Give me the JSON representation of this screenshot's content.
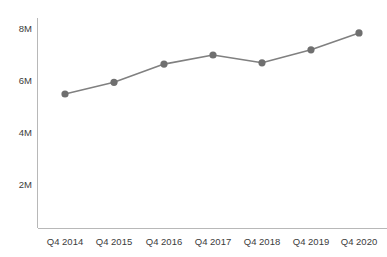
{
  "chart_data": {
    "type": "line",
    "title": "",
    "subtitle": "",
    "xlabel": "",
    "ylabel": "",
    "categories": [
      "Q4 2014",
      "Q4 2015",
      "Q4 2016",
      "Q4 2017",
      "Q4 2018",
      "Q4 2019",
      "Q4 2020"
    ],
    "values": [
      5500000,
      5950000,
      6650000,
      7000000,
      6700000,
      7200000,
      7850000
    ],
    "series": [
      {
        "name": "",
        "values": [
          5500000,
          5950000,
          6650000,
          7000000,
          6700000,
          7200000,
          7850000
        ]
      }
    ],
    "ylim": [
      0,
      8400000
    ],
    "y_ticks": [
      2000000,
      4000000,
      6000000,
      8000000
    ],
    "y_tick_labels": [
      "2M",
      "4M",
      "6M",
      "8M"
    ],
    "grid": false,
    "legend": false,
    "legend_position": "none",
    "line_color": "#808080",
    "marker_color": "#6f6f6f",
    "axis_color": "#b8b8b8",
    "marker": "circle"
  },
  "axes": {
    "y_tick_labels": [
      "8M",
      "6M",
      "4M",
      "2M"
    ],
    "x_tick_labels": [
      "Q4 2014",
      "Q4 2015",
      "Q4 2016",
      "Q4 2017",
      "Q4 2018",
      "Q4 2019",
      "Q4 2020"
    ]
  }
}
